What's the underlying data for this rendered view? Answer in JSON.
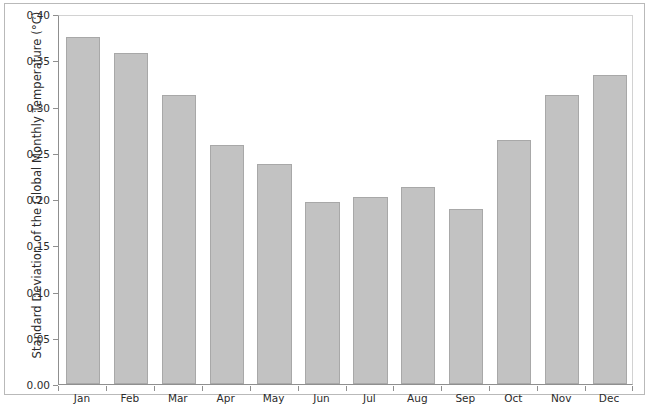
{
  "chart_data": {
    "type": "bar",
    "title": "",
    "xlabel": "",
    "ylabel": "Standard Deviation of the Global Monthly Temperature (°C)",
    "categories": [
      "Jan",
      "Feb",
      "Mar",
      "Apr",
      "May",
      "Jun",
      "Jul",
      "Aug",
      "Sep",
      "Oct",
      "Nov",
      "Dec"
    ],
    "values": [
      0.375,
      0.358,
      0.312,
      0.258,
      0.238,
      0.197,
      0.202,
      0.213,
      0.189,
      0.264,
      0.312,
      0.334
    ],
    "ylim": [
      0.0,
      0.4
    ],
    "ytick_labels": [
      "0.00",
      "0.05",
      "0.10",
      "0.15",
      "0.20",
      "0.25",
      "0.30",
      "0.35",
      "0.40"
    ],
    "ytick_values": [
      0.0,
      0.05,
      0.1,
      0.15,
      0.2,
      0.25,
      0.3,
      0.35,
      0.4
    ],
    "grid": false,
    "legend": null,
    "bar_color": "#c2c2c2",
    "bar_border_color": "#a8a8a8",
    "axis_color": "#8f8f8f",
    "frame_color": "#b9b9b9"
  }
}
